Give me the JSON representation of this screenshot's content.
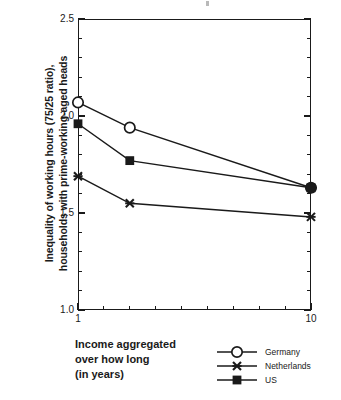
{
  "chart_data": {
    "type": "line",
    "title": "",
    "xlabel": "Income aggregated\nover how long\n(in years)",
    "ylabel": "Inequality of working hours (75/25 ratio),\nhouseholds with prime-working-aged heads",
    "x": [
      1,
      3,
      10
    ],
    "xlim": [
      1,
      10
    ],
    "ylim": [
      1.0,
      2.5
    ],
    "xticks": [
      1,
      10
    ],
    "xtick_labels": [
      "1",
      "10"
    ],
    "yticks": [
      1.0,
      1.5,
      2.0,
      2.5
    ],
    "ytick_labels": [
      "1.0",
      "1.5",
      "2.0",
      "2.5"
    ],
    "y_minor_step": 0.1,
    "x_minor_count": 9,
    "grid": false,
    "legend_position": "bottom-right",
    "series": [
      {
        "name": "Germany",
        "marker": "open-circle",
        "values": [
          2.07,
          1.94,
          1.63
        ],
        "color": "#1a1a1a"
      },
      {
        "name": "Netherlands",
        "marker": "x-cross",
        "values": [
          1.69,
          1.55,
          1.48
        ],
        "color": "#1a1a1a"
      },
      {
        "name": "US",
        "marker": "filled-square",
        "values": [
          1.96,
          1.77,
          1.63
        ],
        "color": "#1a1a1a"
      }
    ]
  },
  "axis": {
    "y_title": "Inequality of working hours (75/25 ratio),\nhouseholds with prime-working-aged heads",
    "x_title": "Income aggregated\nover how long\n(in years)",
    "y_tick_labels": [
      "2.5",
      "2.0",
      "1.5",
      "1.0"
    ],
    "x_tick_labels": [
      "1",
      "10"
    ]
  },
  "legend": {
    "items": [
      {
        "label": "Germany",
        "marker": "open-circle"
      },
      {
        "label": "Netherlands",
        "marker": "x-cross"
      },
      {
        "label": "US",
        "marker": "filled-square"
      }
    ]
  },
  "colors": {
    "ink": "#1a1a1a",
    "paper": "#ffffff"
  }
}
